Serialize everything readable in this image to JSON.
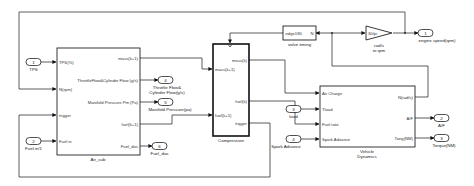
{
  "diagram": {
    "inports": [
      {
        "num": "1",
        "label": "TPS"
      },
      {
        "num": "2",
        "label": "Fuel in/1"
      },
      {
        "num": "3",
        "label": "load"
      },
      {
        "num": "4",
        "label": "Spark Advance"
      }
    ],
    "outports": [
      {
        "num": "1",
        "label": "engine speed(rpm)"
      },
      {
        "num": "2",
        "label": "A/F"
      },
      {
        "num": "3",
        "label": "Torque(NM)"
      },
      {
        "num": "4",
        "label": "Throttle Flow& Cylinder Flow(g/s)",
        "line1": "Throttle Flow&",
        "line2": "Cylinder Flow(g/s)"
      },
      {
        "num": "5",
        "label": "Manifold Pressure(pa)"
      },
      {
        "num": "6",
        "label": "Fuel_das"
      }
    ],
    "blocks": {
      "air_sub": {
        "name": "Air_sub",
        "inputs": [
          "TPS(%)",
          "N(rpm)",
          "trigger",
          "Fuel in"
        ],
        "outputs": [
          "mass(k+1)",
          "ThrottleFlow&Cylinder Flow  (g/s)",
          "Manifold Pressure  Pm (Pa)",
          "fuel(k+1)",
          "Fuel_das"
        ]
      },
      "compression": {
        "name": "Compression",
        "inputs": [
          "mass(k+1)",
          "fuel(k+1)"
        ],
        "outputs": [
          "mass(k)",
          "fuel(k)",
          "trigger"
        ]
      },
      "valve_timing": {
        "name": "valve timing",
        "text": "edge180",
        "port": "N"
      },
      "gain": {
        "value": "30/pi",
        "label_line1": "rad/s",
        "label_line2": "to rpm"
      },
      "vehicle_dynamics": {
        "name_line1": "Vehicle",
        "name_line2": "Dynamics",
        "inputs": [
          "Air Charge",
          "Tload",
          "Fuel rate",
          "Spark Advance"
        ],
        "outputs": [
          "N(rad/s)",
          "A/F",
          "Tang(NM)"
        ]
      }
    }
  }
}
